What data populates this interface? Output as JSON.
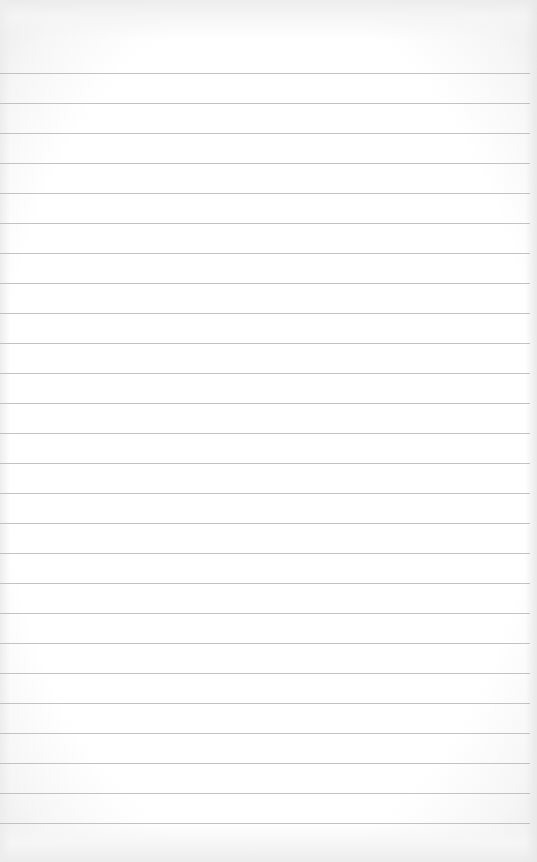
{
  "page": {
    "type": "lined-paper",
    "background_color": "#ffffff",
    "edge_tint_color": "#ececec",
    "rule_color": "#b9b9b9",
    "rules": {
      "count": 26,
      "first_y": 73,
      "spacing": 30,
      "width": 530
    },
    "text_lines": []
  }
}
